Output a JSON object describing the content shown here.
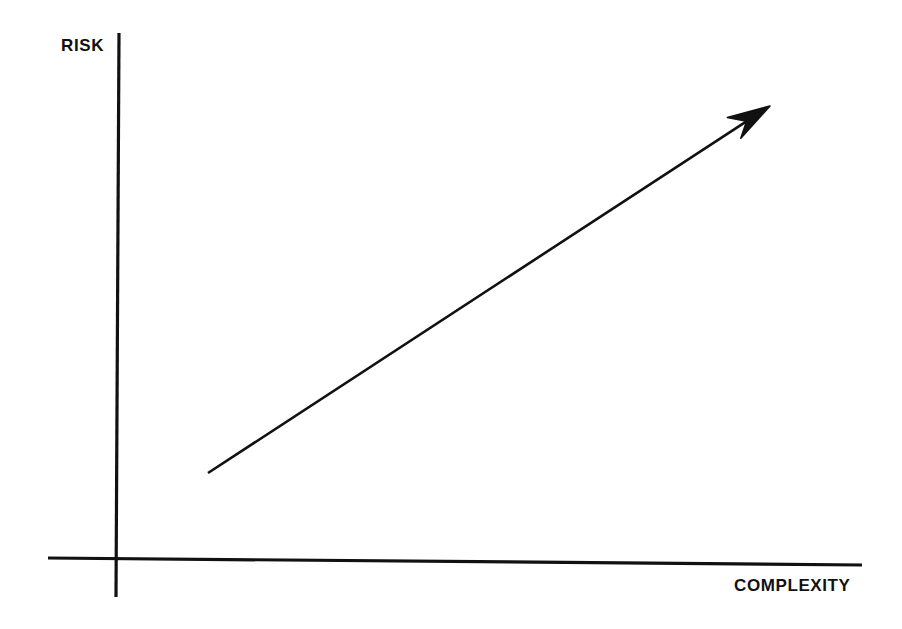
{
  "figure": {
    "background_color": "#ffffff",
    "ink_color": "#111111",
    "y_axis_label": "RISK",
    "x_axis_label": "COMPLEXITY"
  },
  "chart_data": {
    "type": "line",
    "title": "",
    "subtitle": "",
    "xlabel": "COMPLEXITY",
    "ylabel": "RISK",
    "grid": false,
    "legend": null,
    "axis_tick_labels": {
      "x": [],
      "y": []
    },
    "xlim": [
      0,
      10
    ],
    "ylim": [
      0,
      10
    ],
    "annotations": [],
    "series": [
      {
        "name": "Risk increases with complexity",
        "style": "straight-arrow",
        "arrowhead": "end",
        "x": [
          1.2,
          8.6
        ],
        "y": [
          1.7,
          8.7
        ]
      }
    ]
  },
  "geometry": {
    "y_axis": {
      "x1": 119,
      "y1": 33,
      "x2": 116,
      "y2": 597
    },
    "x_axis": {
      "x1": 48,
      "y1": 558,
      "x2": 862,
      "y2": 565
    },
    "arrow": {
      "x1": 208,
      "y1": 473,
      "x2": 770,
      "y2": 106
    }
  }
}
